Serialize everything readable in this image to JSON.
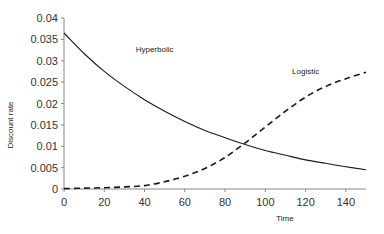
{
  "chart_data": {
    "type": "line",
    "title": "",
    "xlabel": "Time",
    "ylabel": "Discount rate",
    "xlim": [
      0,
      150
    ],
    "ylim": [
      0,
      0.04
    ],
    "xticks": [
      0,
      20,
      40,
      60,
      80,
      100,
      120,
      140
    ],
    "yticks": [
      0,
      0.005,
      0.01,
      0.015,
      0.02,
      0.025,
      0.03,
      0.035,
      0.04
    ],
    "ytick_labels": [
      "0",
      "0.005",
      "0.01",
      "0.015",
      "0.02",
      "0.025",
      "0.03",
      "0.035",
      "0.04"
    ],
    "grid": false,
    "legend": "none (inline annotations)",
    "x": [
      0,
      10,
      20,
      30,
      40,
      50,
      60,
      70,
      80,
      90,
      100,
      110,
      120,
      130,
      140,
      150
    ],
    "series": [
      {
        "name": "Hyperbolic",
        "style": "solid",
        "values": [
          0.0365,
          0.0317,
          0.0275,
          0.024,
          0.0209,
          0.0182,
          0.0158,
          0.0137,
          0.012,
          0.0104,
          0.009,
          0.0079,
          0.0068,
          0.006,
          0.0052,
          0.0045
        ]
      },
      {
        "name": "Logistic",
        "style": "dashed",
        "values": [
          0.0001,
          0.0002,
          0.0003,
          0.0005,
          0.0008,
          0.0017,
          0.003,
          0.0048,
          0.0074,
          0.0108,
          0.0145,
          0.0182,
          0.0215,
          0.024,
          0.0258,
          0.0273
        ]
      }
    ],
    "annotations": [
      {
        "text": "Hyperbolic",
        "x": 45,
        "y": 0.032
      },
      {
        "text": "Logistic",
        "x": 120,
        "y": 0.027
      }
    ]
  }
}
